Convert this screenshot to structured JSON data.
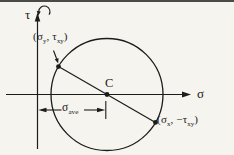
{
  "diagram": {
    "axis": {
      "vertical": "τ",
      "horizontal": "σ"
    },
    "center": {
      "label": "C"
    },
    "point_top": {
      "open": "(",
      "var1": "σ",
      "sub1": "y",
      "comma": ", ",
      "var2": "τ",
      "sub2": "xy",
      "close": ")"
    },
    "point_bottom": {
      "open": "(",
      "var1": "σ",
      "sub1": "x",
      "comma": ", ",
      "sign": "−",
      "var2": "τ",
      "sub2": "xy",
      "close": ")"
    },
    "dimension": {
      "var": "σ",
      "sub": "ave"
    },
    "colors": {
      "ink": "#1c1c1c",
      "paper": "#f5f4ee",
      "top_rule": "#4a4a48"
    }
  }
}
